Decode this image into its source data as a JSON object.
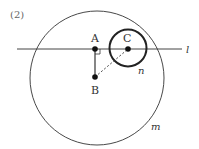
{
  "figure": {
    "problem_number": "(2)",
    "colors": {
      "stroke": "#333333",
      "background": "#ffffff"
    }
  },
  "points": {
    "A": {
      "label": "A",
      "x": 95,
      "y": 49
    },
    "B": {
      "label": "B",
      "x": 95,
      "y": 77
    },
    "C": {
      "label": "C",
      "x": 128,
      "y": 49
    }
  },
  "line": {
    "label": "l"
  },
  "circles": {
    "m": {
      "label": "m",
      "cx": 97,
      "cy": 78,
      "r": 67
    },
    "n": {
      "label": "n",
      "cx": 128,
      "cy": 48,
      "r": 18.5
    }
  },
  "segments": [
    {
      "from": "A",
      "to": "B",
      "style": "solid"
    },
    {
      "from": "B",
      "to": "C",
      "style": "dashed"
    }
  ],
  "annotations": {
    "right_angle_at": "A"
  }
}
